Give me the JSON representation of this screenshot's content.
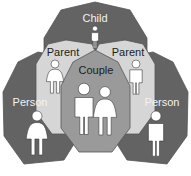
{
  "diagram": {
    "colors": {
      "background": "#ffffff",
      "dark_gray": "#636363",
      "mid_gray": "#9a9a9a",
      "light_gray": "#d6d6d6",
      "figure_fill": "#ffffff",
      "edge": "#555555",
      "label_dark": "#1c1c1c",
      "label_light": "#f2f2f2"
    },
    "regions": [
      {
        "id": "child",
        "label": "Child",
        "fill_name": "dark_gray",
        "label_color": "label_light",
        "figure": "person-neutral",
        "position": "top-center"
      },
      {
        "id": "parent-left",
        "label": "Parent",
        "fill_name": "light_gray",
        "label_color": "label_dark",
        "figure": "person-female",
        "position": "upper-left"
      },
      {
        "id": "parent-right",
        "label": "Parent",
        "fill_name": "light_gray",
        "label_color": "label_dark",
        "figure": "person-male",
        "position": "upper-right"
      },
      {
        "id": "couple",
        "label": "Couple",
        "fill_name": "mid_gray",
        "label_color": "label_dark",
        "figure": "person-male-and-female",
        "position": "center"
      },
      {
        "id": "person-left",
        "label": "Person",
        "fill_name": "dark_gray",
        "label_color": "label_light",
        "figure": "person-female",
        "position": "lower-left"
      },
      {
        "id": "person-right",
        "label": "Person",
        "fill_name": "dark_gray",
        "label_color": "label_light",
        "figure": "person-male",
        "position": "lower-right"
      }
    ]
  }
}
